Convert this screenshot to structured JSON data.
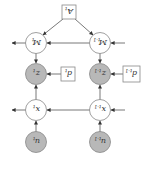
{
  "diagram": {
    "orientation": "rotated-180",
    "nodes": {
      "A_t": {
        "label": "A",
        "sub": "t",
        "shape": "square",
        "fill": "#ffffff",
        "cx": 69,
        "cy": 12
      },
      "M_t": {
        "label": "M",
        "sub": "t",
        "shape": "circle",
        "fill": "#ffffff",
        "cx": 36,
        "cy": 43
      },
      "M_tm1": {
        "label": "M",
        "sub": "t-1",
        "shape": "circle",
        "fill": "#ffffff",
        "cx": 100,
        "cy": 43
      },
      "z_t": {
        "label": "z",
        "sub": "t",
        "shape": "circle",
        "fill": "#b8b8b8",
        "cx": 36,
        "cy": 74
      },
      "d_t": {
        "label": "d",
        "sub": "t",
        "shape": "square",
        "fill": "#ffffff",
        "cx": 68,
        "cy": 74
      },
      "z_tm1": {
        "label": "z",
        "sub": "t-1",
        "shape": "circle",
        "fill": "#b8b8b8",
        "cx": 100,
        "cy": 74
      },
      "d_tm1": {
        "label": "d",
        "sub": "t-1",
        "shape": "square",
        "fill": "#ffffff",
        "cx": 131,
        "cy": 74
      },
      "x_t": {
        "label": "x",
        "sub": "t",
        "shape": "circle",
        "fill": "#ffffff",
        "cx": 36,
        "cy": 110
      },
      "x_tm1": {
        "label": "x",
        "sub": "t-1",
        "shape": "circle",
        "fill": "#ffffff",
        "cx": 100,
        "cy": 110
      },
      "u_t": {
        "label": "u",
        "sub": "t",
        "shape": "circle",
        "fill": "#b8b8b8",
        "cx": 36,
        "cy": 142
      },
      "u_tm1": {
        "label": "u",
        "sub": "t-1",
        "shape": "circle",
        "fill": "#b8b8b8",
        "cx": 100,
        "cy": 142
      }
    },
    "edges": [
      [
        "A_t",
        "M_t"
      ],
      [
        "A_t",
        "M_tm1"
      ],
      [
        "M_tm1",
        "M_t"
      ],
      [
        "M_t",
        "z_t"
      ],
      [
        "M_tm1",
        "z_tm1"
      ],
      [
        "d_t",
        "z_t"
      ],
      [
        "d_tm1",
        "z_tm1"
      ],
      [
        "x_t",
        "z_t"
      ],
      [
        "x_tm1",
        "z_tm1"
      ],
      [
        "x_tm1",
        "x_t"
      ],
      [
        "u_t",
        "x_t"
      ],
      [
        "u_tm1",
        "x_tm1"
      ]
    ],
    "colors": {
      "observed": "#b8b8b8",
      "latent": "#ffffff",
      "stroke": "#666666"
    }
  }
}
